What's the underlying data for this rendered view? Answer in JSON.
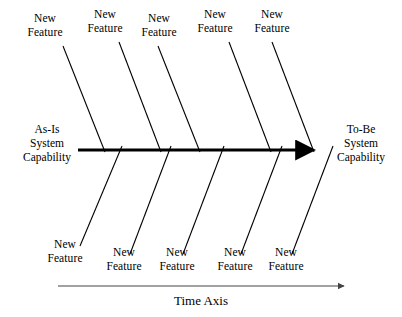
{
  "diagram": {
    "type": "fishbone-ishikawa",
    "spine": {
      "start_label": "As-Is\nSystem\nCapability",
      "end_label": "To-Be\nSystem\nCapability",
      "color": "#000000",
      "thickness_px": 3,
      "arrow": "right-arrowhead"
    },
    "time_axis": {
      "label": "Time Axis",
      "color": "#444444",
      "arrow": "right-arrowhead"
    },
    "bones_top": [
      {
        "label": "New\nFeature",
        "label_x": 22,
        "label_y": 12,
        "x1": 63,
        "y1": 46,
        "x2": 105,
        "y2": 152
      },
      {
        "label": "New\nFeature",
        "label_x": 82,
        "label_y": 8,
        "x1": 119,
        "y1": 42,
        "x2": 161,
        "y2": 152
      },
      {
        "label": "New\nFeature",
        "label_x": 136,
        "label_y": 12,
        "x1": 158,
        "y1": 46,
        "x2": 200,
        "y2": 152
      },
      {
        "label": "New\nFeature",
        "label_x": 192,
        "label_y": 8,
        "x1": 229,
        "y1": 42,
        "x2": 271,
        "y2": 152
      },
      {
        "label": "New\nFeature",
        "label_x": 249,
        "label_y": 8,
        "x1": 272,
        "y1": 42,
        "x2": 314,
        "y2": 152
      }
    ],
    "bones_bottom": [
      {
        "label": "New\nFeature",
        "label_x": 42,
        "label_y": 238,
        "x1": 122,
        "y1": 146,
        "x2": 80,
        "y2": 246
      },
      {
        "label": "New\nFeature",
        "label_x": 101,
        "label_y": 246,
        "x1": 171,
        "y1": 146,
        "x2": 130,
        "y2": 254
      },
      {
        "label": "New\nFeature",
        "label_x": 154,
        "label_y": 246,
        "x1": 224,
        "y1": 146,
        "x2": 183,
        "y2": 254
      },
      {
        "label": "New\nFeature",
        "label_x": 212,
        "label_y": 246,
        "x1": 282,
        "y1": 146,
        "x2": 241,
        "y2": 254
      },
      {
        "label": "New\nFeature",
        "label_x": 263,
        "label_y": 246,
        "x1": 333,
        "y1": 146,
        "x2": 292,
        "y2": 254
      }
    ]
  },
  "labels": {
    "left_capability": "As-Is\nSystem\nCapability",
    "right_capability": "To-Be\nSystem\nCapability",
    "time_axis": "Time Axis",
    "feature": "New\nFeature"
  }
}
